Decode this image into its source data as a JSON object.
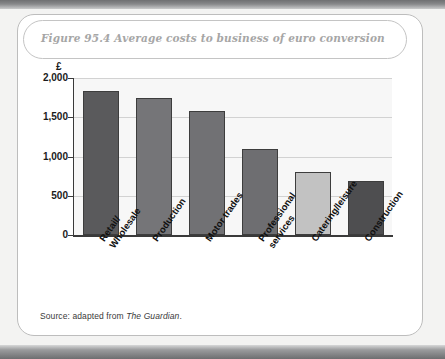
{
  "figure": {
    "caption": "Figure 95.4  Average costs to business of euro conversion",
    "source_prefix": "Source: adapted from ",
    "source_publication": "The Guardian",
    "source_suffix": "."
  },
  "chart_data": {
    "type": "bar",
    "title": "Figure 95.4  Average costs to business of euro conversion",
    "xlabel": "",
    "ylabel": "£",
    "categories": [
      "Retail/ Wholesale",
      "Production",
      "Motor trades",
      "Professional services",
      "Catering/leisure",
      "Construction"
    ],
    "category_lines": [
      [
        "Retail/",
        "Wholesale"
      ],
      [
        "Production"
      ],
      [
        "Motor trades"
      ],
      [
        "Professional",
        "services"
      ],
      [
        "Catering/leisure"
      ],
      [
        "Construction"
      ]
    ],
    "values": [
      1840,
      1750,
      1580,
      1100,
      800,
      690
    ],
    "bar_colors": [
      "#5a5a5c",
      "#757578",
      "#717174",
      "#6e6e71",
      "#c2c2c2",
      "#4e4e50"
    ],
    "ylim": [
      0,
      2000
    ],
    "yticks": [
      0,
      500,
      1000,
      1500,
      2000
    ],
    "ytick_labels": [
      "0",
      "500",
      "1,000",
      "1,500",
      "2,000"
    ],
    "grid": true,
    "legend": "none"
  }
}
